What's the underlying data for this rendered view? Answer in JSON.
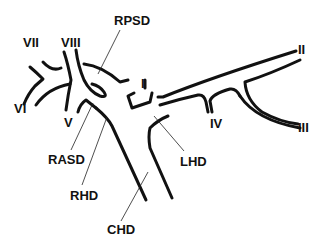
{
  "diagram": {
    "type": "biliary-duct-anatomy",
    "labels": {
      "rpsd": "RPSD",
      "rasd": "RASD",
      "rhd": "RHD",
      "lhd": "LHD",
      "chd": "CHD",
      "seg_i": "I",
      "seg_ii": "II",
      "seg_iii": "III",
      "seg_iv": "IV",
      "seg_v": "V",
      "seg_vi": "VI",
      "seg_vii": "VII",
      "seg_viii": "VIII"
    },
    "colors": {
      "line": "#111111",
      "background": "#ffffff"
    }
  }
}
